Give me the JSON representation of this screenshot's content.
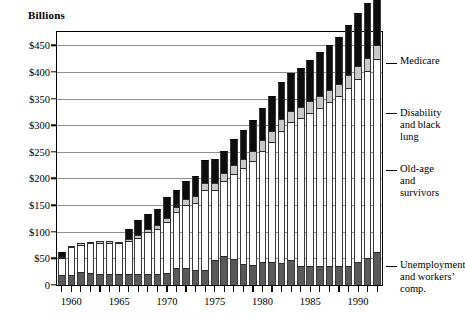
{
  "chart": {
    "axis_title": "Billions",
    "y_ticks": [
      "$450",
      "$400",
      "$350",
      "$300",
      "$250",
      "$200",
      "$150",
      "$100",
      "$50",
      "0"
    ],
    "x_ticks": [
      "1960",
      "1965",
      "1970",
      "1975",
      "1980",
      "1985",
      "1990"
    ],
    "callouts": {
      "medicare": "Medicare",
      "disability": "Disability\nand black\nlung",
      "oldage": "Old-age\nand\nsurvivors",
      "unemployment": "Unemployment\nand workers’\ncomp."
    },
    "colors": {
      "unemployment": "#595959",
      "old_age_survivors": "#ffffff",
      "disability_black_lung": "#c9c9c9",
      "medicare": "#0d0d0d",
      "axis": "#000000",
      "gridline": "#8f8f8f"
    }
  },
  "chart_data": {
    "type": "bar",
    "title": "",
    "subtitle": "",
    "xlabel": "",
    "ylabel": "Billions",
    "ylim": [
      0,
      475
    ],
    "ytick_values": [
      0,
      50,
      100,
      150,
      200,
      250,
      300,
      350,
      400,
      450
    ],
    "grid": true,
    "stacked": true,
    "legend_position": "right-callouts",
    "categories": [
      "1959",
      "1960",
      "1961",
      "1962",
      "1963",
      "1964",
      "1965",
      "1966",
      "1967",
      "1968",
      "1969",
      "1970",
      "1971",
      "1972",
      "1973",
      "1974",
      "1975",
      "1976",
      "1977",
      "1978",
      "1979",
      "1980",
      "1981",
      "1982",
      "1983",
      "1984",
      "1985",
      "1986",
      "1987",
      "1988",
      "1989",
      "1990",
      "1991",
      "1992"
    ],
    "series": [
      {
        "name": "Unemployment and workers' comp.",
        "color": "#595959",
        "values": [
          19,
          19,
          25,
          22,
          21,
          20,
          20,
          20,
          20,
          20,
          21,
          22,
          31,
          32,
          28,
          28,
          47,
          55,
          48,
          39,
          37,
          43,
          43,
          42,
          47,
          36,
          36,
          36,
          36,
          36,
          36,
          44,
          50,
          62
        ]
      },
      {
        "name": "Old-age and survivors",
        "color": "#ffffff",
        "values": [
          31,
          52,
          51,
          56,
          58,
          59,
          58,
          63,
          68,
          79,
          85,
          97,
          106,
          118,
          126,
          151,
          131,
          140,
          161,
          180,
          196,
          209,
          226,
          248,
          259,
          277,
          287,
          297,
          307,
          319,
          334,
          343,
          351,
          362
        ]
      },
      {
        "name": "Disability and black lung",
        "color": "#c9c9c9",
        "values": [
          2,
          2,
          2,
          3,
          3,
          3,
          3,
          4,
          5,
          6,
          6,
          7,
          9,
          11,
          13,
          12,
          14,
          15,
          17,
          18,
          19,
          20,
          20,
          21,
          21,
          21,
          22,
          22,
          23,
          23,
          24,
          25,
          26,
          27
        ]
      },
      {
        "name": "Medicare",
        "color": "#0d0d0d",
        "values": [
          10,
          0,
          0,
          0,
          0,
          0,
          0,
          19,
          29,
          28,
          31,
          40,
          32,
          35,
          38,
          43,
          45,
          42,
          48,
          54,
          58,
          61,
          66,
          71,
          71,
          74,
          78,
          82,
          85,
          88,
          95,
          99,
          102,
          108
        ]
      }
    ],
    "totals": [
      62,
      73,
      78,
      81,
      82,
      82,
      81,
      96,
      106,
      123,
      143,
      166,
      178,
      196,
      205,
      234,
      237,
      252,
      274,
      291,
      310,
      333,
      355,
      382,
      398,
      408,
      423,
      437,
      451,
      466,
      489,
      511,
      529,
      559
    ],
    "annotations": [
      {
        "label": "Medicare",
        "target_series": "Medicare"
      },
      {
        "label": "Disability and black lung",
        "target_series": "Disability and black lung"
      },
      {
        "label": "Old-age and survivors",
        "target_series": "Old-age and survivors"
      },
      {
        "label": "Unemployment and workers' comp.",
        "target_series": "Unemployment and workers' comp."
      }
    ]
  }
}
